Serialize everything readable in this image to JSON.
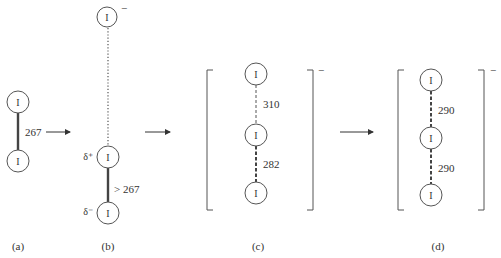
{
  "colors": {
    "ink": "#333333",
    "line": "#555555",
    "background": "#ffffff"
  },
  "atom_symbol": "I",
  "panels": {
    "a": {
      "label": "(a)",
      "bond_length": "267",
      "bond_style": "solid-thick"
    },
    "b": {
      "label": "(b)",
      "top_charge": "−",
      "delta_plus": "δ⁺",
      "delta_minus": "δ⁻",
      "bond_length": "> 267",
      "upper_bond_style": "dotted",
      "lower_bond_style": "solid-thick"
    },
    "c": {
      "label": "(c)",
      "charge": "−",
      "upper_bond_length": "310",
      "lower_bond_length": "282",
      "upper_bond_style": "dashed-thin",
      "lower_bond_style": "dashed-thick"
    },
    "d": {
      "label": "(d)",
      "charge": "−",
      "upper_bond_length": "290",
      "lower_bond_length": "290",
      "upper_bond_style": "dashed-thick",
      "lower_bond_style": "dashed-thick"
    }
  },
  "arrows": [
    {
      "from": "a",
      "to": "b"
    },
    {
      "from": "b",
      "to": "c"
    },
    {
      "from": "c",
      "to": "d"
    }
  ]
}
